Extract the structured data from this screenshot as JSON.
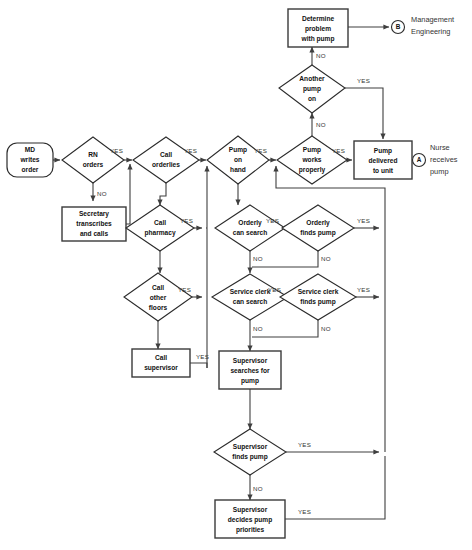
{
  "diagram": {
    "colors": {
      "stroke": "#3f3f3f",
      "text": "#111111",
      "background": "#ffffff"
    },
    "nodes": [
      {
        "id": "md_writes_order",
        "type": "terminator",
        "label": "MD\nwrites\norder",
        "cx": 30,
        "cy": 160,
        "w": 46,
        "h": 34
      },
      {
        "id": "rn_orders",
        "type": "decision",
        "label": "RN\norders",
        "cx": 93,
        "cy": 160,
        "w": 62,
        "h": 46
      },
      {
        "id": "secretary_transcribes",
        "type": "process",
        "label": "Secretary\ntranscribes\nand calls",
        "cx": 94,
        "cy": 224,
        "w": 64,
        "h": 34
      },
      {
        "id": "call_orderlies",
        "type": "decision",
        "label": "Call\norderlies",
        "cx": 166,
        "cy": 160,
        "w": 66,
        "h": 46
      },
      {
        "id": "call_pharmacy",
        "type": "decision",
        "label": "Call\npharmacy",
        "cx": 160,
        "cy": 228,
        "w": 68,
        "h": 46
      },
      {
        "id": "call_other_floors",
        "type": "decision",
        "label": "Call\nother\nfloors",
        "cx": 158,
        "cy": 297,
        "w": 68,
        "h": 48
      },
      {
        "id": "call_supervisor",
        "type": "process",
        "label": "Call\nsupervisor",
        "cx": 161,
        "cy": 363,
        "w": 58,
        "h": 28
      },
      {
        "id": "pump_on_hand",
        "type": "decision",
        "label": "Pump\non\nhand",
        "cx": 238,
        "cy": 160,
        "w": 62,
        "h": 48
      },
      {
        "id": "orderly_can_search",
        "type": "decision",
        "label": "Orderly\ncan search",
        "cx": 250,
        "cy": 228,
        "w": 70,
        "h": 46
      },
      {
        "id": "orderly_finds_pump",
        "type": "decision",
        "label": "Orderly\nfinds pump",
        "cx": 318,
        "cy": 228,
        "w": 72,
        "h": 46
      },
      {
        "id": "service_clerk_can_search",
        "type": "decision",
        "label": "Service clerk\ncan search",
        "cx": 250,
        "cy": 297,
        "w": 76,
        "h": 46
      },
      {
        "id": "service_clerk_finds_pump",
        "type": "decision",
        "label": "Service clerk\nfinds pump",
        "cx": 318,
        "cy": 297,
        "w": 76,
        "h": 46
      },
      {
        "id": "supervisor_searches",
        "type": "process",
        "label": "Supervisor\nsearches for\npump",
        "cx": 250,
        "cy": 370,
        "w": 62,
        "h": 38
      },
      {
        "id": "supervisor_finds_pump",
        "type": "decision",
        "label": "Supervisor\nfinds pump",
        "cx": 250,
        "cy": 452,
        "w": 72,
        "h": 46
      },
      {
        "id": "supervisor_decides",
        "type": "process",
        "label": "Supervisor\ndecides pump\npriorities",
        "cx": 250,
        "cy": 519,
        "w": 70,
        "h": 38
      },
      {
        "id": "pump_works_properly",
        "type": "decision",
        "label": "Pump\nworks\nproperly",
        "cx": 312,
        "cy": 160,
        "w": 70,
        "h": 48
      },
      {
        "id": "another_pump_on",
        "type": "decision",
        "label": "Another\npump\non",
        "cx": 312,
        "cy": 88,
        "w": 66,
        "h": 46
      },
      {
        "id": "determine_problem",
        "type": "process",
        "label": "Determine\nproblem\nwith pump",
        "cx": 318,
        "cy": 27,
        "w": 60,
        "h": 36
      },
      {
        "id": "pump_delivered",
        "type": "process",
        "label": "Pump\ndelivered\nto unit",
        "cx": 383,
        "cy": 160,
        "w": 58,
        "h": 38
      },
      {
        "id": "connector_b",
        "type": "connector",
        "label": "B",
        "cx": 399,
        "cy": 27,
        "r": 7
      },
      {
        "id": "connector_a",
        "type": "connector",
        "label": "A",
        "cx": 414,
        "cy": 160,
        "r": 7
      }
    ],
    "outside_labels": [
      {
        "id": "management_engineering",
        "text_line1": "Management",
        "text_line2": "Engineering",
        "x": 412,
        "y": 21
      },
      {
        "id": "nurse_receives_pump",
        "text_line1": "Nurse",
        "text_line2": "receives",
        "text_line3": "pump",
        "x": 426,
        "y": 148
      }
    ],
    "edge_labels": [
      {
        "id": "rn-yes",
        "text": "YES",
        "x": 118,
        "y": 151
      },
      {
        "id": "rn-no",
        "text": "NO",
        "x": 97,
        "y": 192
      },
      {
        "id": "orderlies-yes",
        "text": "YES",
        "x": 192,
        "y": 151
      },
      {
        "id": "pharmacy-yes",
        "text": "YES",
        "x": 190,
        "y": 221
      },
      {
        "id": "other-floors-yes",
        "text": "YES",
        "x": 190,
        "y": 290
      },
      {
        "id": "supervisor-call-yes",
        "text": "YES",
        "x": 197,
        "y": 360
      },
      {
        "id": "pump-on-hand-yes",
        "text": "YES",
        "x": 266,
        "y": 151
      },
      {
        "id": "pump-works-yes",
        "text": "YES",
        "x": 342,
        "y": 151
      },
      {
        "id": "pump-works-no",
        "text": "NO",
        "x": 316,
        "y": 124
      },
      {
        "id": "another-pump-no-down",
        "text": "NO",
        "x": 316,
        "y": 124
      },
      {
        "id": "another-pump-yes",
        "text": "YES",
        "x": 358,
        "y": 81
      },
      {
        "id": "another-pump-no-up",
        "text": "NO",
        "x": 316,
        "y": 55
      },
      {
        "id": "orderly-can-search-yes",
        "text": "YES",
        "x": 278,
        "y": 220
      },
      {
        "id": "orderly-can-search-no",
        "text": "NO",
        "x": 253,
        "y": 256
      },
      {
        "id": "orderly-finds-yes",
        "text": "YES",
        "x": 358,
        "y": 220
      },
      {
        "id": "orderly-finds-no",
        "text": "NO",
        "x": 321,
        "y": 256
      },
      {
        "id": "clerk-can-search-yes",
        "text": "YES",
        "x": 280,
        "y": 290
      },
      {
        "id": "clerk-can-search-no",
        "text": "NO",
        "x": 253,
        "y": 326
      },
      {
        "id": "clerk-finds-yes",
        "text": "YES",
        "x": 358,
        "y": 290
      },
      {
        "id": "clerk-finds-no",
        "text": "NO",
        "x": 321,
        "y": 326
      },
      {
        "id": "supervisor-finds-yes",
        "text": "YES",
        "x": 300,
        "y": 445
      },
      {
        "id": "supervisor-decides-yes",
        "text": "YES",
        "x": 300,
        "y": 512
      }
    ]
  }
}
